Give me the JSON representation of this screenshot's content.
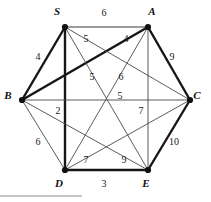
{
  "figure": {
    "type": "weighted-graph",
    "shape": "hexagon-with-diagonals",
    "background": "#ffffff",
    "edge_color": "#161616",
    "node_color": "#111111"
  },
  "nodes": [
    {
      "id": "S",
      "label": "S",
      "x": 65,
      "y": 27,
      "label_x": 57,
      "label_y": 15
    },
    {
      "id": "A",
      "label": "A",
      "x": 148,
      "y": 27,
      "label_x": 152,
      "label_y": 15
    },
    {
      "id": "B",
      "label": "B",
      "x": 22,
      "y": 100,
      "label_x": 8,
      "label_y": 99
    },
    {
      "id": "C",
      "label": "C",
      "x": 190,
      "y": 100,
      "label_x": 197,
      "label_y": 99
    },
    {
      "id": "D",
      "label": "D",
      "x": 65,
      "y": 170,
      "label_x": 59,
      "label_y": 187
    },
    {
      "id": "E",
      "label": "E",
      "x": 148,
      "y": 170,
      "label_x": 146,
      "label_y": 187
    }
  ],
  "edges": [
    {
      "from": "S",
      "to": "A",
      "weight": "6",
      "weight_x": 104,
      "weight_y": 16,
      "style": "med"
    },
    {
      "from": "B",
      "to": "S",
      "weight": "4",
      "weight_x": 38,
      "weight_y": 60,
      "style": "thick"
    },
    {
      "from": "A",
      "to": "C",
      "weight": "9",
      "weight_x": 172,
      "weight_y": 60,
      "style": "thick"
    },
    {
      "from": "C",
      "to": "E",
      "weight": "10",
      "weight_x": 174,
      "weight_y": 145,
      "style": "thick"
    },
    {
      "from": "D",
      "to": "E",
      "weight": "3",
      "weight_x": 104,
      "weight_y": 187,
      "style": "thick"
    },
    {
      "from": "B",
      "to": "D",
      "weight": "6",
      "weight_x": 38,
      "weight_y": 145,
      "style": "thin"
    },
    {
      "from": "S",
      "to": "D",
      "weight": "2",
      "weight_x": 58,
      "weight_y": 114,
      "style": "thick"
    },
    {
      "from": "A",
      "to": "E",
      "weight": "7",
      "weight_x": 141,
      "weight_y": 114,
      "style": "thin"
    },
    {
      "from": "B",
      "to": "C",
      "weight": "5",
      "weight_x": 120,
      "weight_y": 99,
      "style": "thin"
    },
    {
      "from": "B",
      "to": "A",
      "weight": "4",
      "weight_x": 126,
      "weight_y": 42,
      "style": "thick"
    },
    {
      "from": "S",
      "to": "E",
      "weight": "5",
      "weight_x": 86,
      "weight_y": 42,
      "style": "thin"
    },
    {
      "from": "S",
      "to": "C",
      "weight": "5",
      "weight_x": 92,
      "weight_y": 80,
      "style": "thin"
    },
    {
      "from": "A",
      "to": "D",
      "weight": "6",
      "weight_x": 121,
      "weight_y": 80,
      "style": "thin"
    },
    {
      "from": "D",
      "to": "C",
      "weight": "7",
      "weight_x": 86,
      "weight_y": 163,
      "style": "thin"
    },
    {
      "from": "B",
      "to": "E",
      "weight": "9",
      "weight_x": 124,
      "weight_y": 163,
      "style": "thin"
    }
  ],
  "footer_rule": {
    "x1": 0,
    "y1": 196,
    "x2": 82,
    "y2": 196
  }
}
